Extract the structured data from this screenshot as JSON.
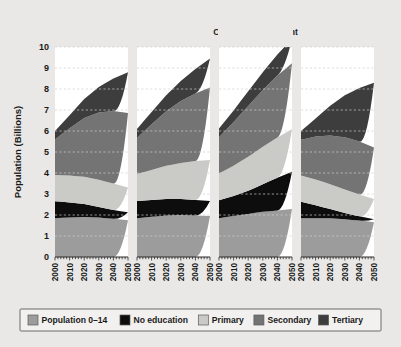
{
  "figure": {
    "background": "#e9e8e6",
    "panel_background": "#ffffff"
  },
  "chart_data": {
    "type": "area",
    "title": "",
    "subtitle": "",
    "xlabel": "",
    "ylabel": "Population (Billions)",
    "x": [
      2000,
      2010,
      2020,
      2030,
      2040,
      2050
    ],
    "xtick_labels": [
      "2000",
      "2010",
      "2020",
      "2030",
      "2040",
      "2050"
    ],
    "xlim": [
      2000,
      2050
    ],
    "ylim": [
      0,
      10
    ],
    "ytick_labels": [
      "0",
      "1",
      "2",
      "3",
      "4",
      "5",
      "6",
      "7",
      "8",
      "9",
      "10"
    ],
    "ytick_values": [
      0,
      1,
      2,
      3,
      4,
      5,
      6,
      7,
      8,
      9,
      10
    ],
    "grid": true,
    "grid_axis": "y",
    "legend_position": "bottom",
    "stacked": true,
    "series_order": [
      "Population 0-14",
      "No education",
      "Primary",
      "Secondary",
      "Tertiary"
    ],
    "colors": {
      "Population 0-14": "#9c9c9c",
      "No education": "#0d0d0d",
      "Primary": "#cacac6",
      "Secondary": "#747474",
      "Tertiary": "#3d3d3d"
    },
    "panels": [
      {
        "title": "Global Education Trend",
        "title_lines": [
          "Global",
          "Education Trend"
        ],
        "series": [
          {
            "name": "Population 0-14",
            "values": [
              1.85,
              1.88,
              1.9,
              1.88,
              1.82,
              1.75
            ]
          },
          {
            "name": "No education",
            "values": [
              0.8,
              0.72,
              0.62,
              0.5,
              0.42,
              0.38
            ]
          },
          {
            "name": "Primary",
            "values": [
              1.25,
              1.28,
              1.3,
              1.3,
              1.26,
              1.18
            ]
          },
          {
            "name": "Secondary",
            "values": [
              1.7,
              2.25,
              2.8,
              3.2,
              3.45,
              3.55
            ]
          },
          {
            "name": "Tertiary",
            "values": [
              0.4,
              0.62,
              0.9,
              1.22,
              1.55,
              1.94
            ]
          }
        ],
        "totals": [
          6.0,
          6.75,
          7.52,
          8.1,
          8.5,
          8.8
        ]
      },
      {
        "title": "Constant Enrollment Rate",
        "title_lines": [
          "Constant",
          "Enrollment Rate"
        ],
        "series": [
          {
            "name": "Population 0-14",
            "values": [
              1.85,
              1.92,
              1.98,
              2.0,
              1.98,
              1.95
            ]
          },
          {
            "name": "No education",
            "values": [
              0.82,
              0.8,
              0.78,
              0.76,
              0.74,
              0.72
            ]
          },
          {
            "name": "Primary",
            "values": [
              1.28,
              1.42,
              1.58,
              1.72,
              1.85,
              1.95
            ]
          },
          {
            "name": "Secondary",
            "values": [
              1.72,
              2.18,
              2.6,
              2.95,
              3.22,
              3.45
            ]
          },
          {
            "name": "Tertiary",
            "values": [
              0.43,
              0.58,
              0.76,
              0.95,
              1.16,
              1.38
            ]
          }
        ],
        "totals": [
          6.1,
          6.9,
          7.7,
          8.38,
          8.95,
          9.45
        ]
      },
      {
        "title": "Constant Enrollment",
        "title_lines": [
          "Constant Enrollment"
        ],
        "series": [
          {
            "name": "Population 0-14",
            "values": [
              1.85,
              1.95,
              2.05,
              2.15,
              2.22,
              2.28
            ]
          },
          {
            "name": "No education",
            "values": [
              0.85,
              0.95,
              1.1,
              1.32,
              1.55,
              1.78
            ]
          },
          {
            "name": "Primary",
            "values": [
              1.28,
              1.45,
              1.62,
              1.78,
              1.92,
              2.02
            ]
          },
          {
            "name": "Secondary",
            "values": [
              1.72,
              2.08,
              2.42,
              2.7,
              2.95,
              3.15
            ]
          },
          {
            "name": "Tertiary",
            "values": [
              0.42,
              0.55,
              0.7,
              0.85,
              1.0,
              1.15
            ]
          }
        ],
        "totals": [
          6.12,
          6.98,
          7.89,
          8.8,
          9.64,
          10.38
        ]
      },
      {
        "title": "Fast Track",
        "title_lines": [
          "Fast Track"
        ],
        "series": [
          {
            "name": "Population 0-14",
            "values": [
              1.85,
              1.85,
              1.84,
              1.8,
              1.74,
              1.66
            ]
          },
          {
            "name": "No education",
            "values": [
              0.78,
              0.62,
              0.45,
              0.3,
              0.2,
              0.14
            ]
          },
          {
            "name": "Primary",
            "values": [
              1.25,
              1.22,
              1.18,
              1.12,
              1.04,
              0.96
            ]
          },
          {
            "name": "Secondary",
            "values": [
              1.7,
              2.05,
              2.32,
              2.48,
              2.52,
              2.46
            ]
          },
          {
            "name": "Tertiary",
            "values": [
              0.42,
              0.86,
              1.41,
              2.0,
              2.55,
              3.08
            ]
          }
        ],
        "totals": [
          6.0,
          6.6,
          7.2,
          7.7,
          8.05,
          8.3
        ]
      }
    ],
    "legend": [
      {
        "label": "Population 0–14",
        "color": "#9c9c9c"
      },
      {
        "label": "No education",
        "color": "#0d0d0d"
      },
      {
        "label": "Primary",
        "color": "#cacac6"
      },
      {
        "label": "Secondary",
        "color": "#747474"
      },
      {
        "label": "Tertiary",
        "color": "#3d3d3d"
      }
    ]
  }
}
